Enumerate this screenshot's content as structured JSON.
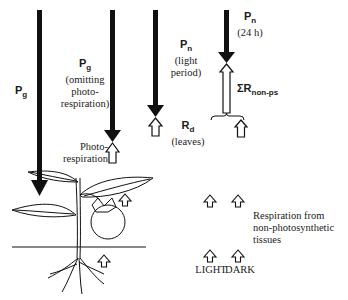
{
  "diagram": {
    "arrows": [
      {
        "id": "pg",
        "symbol": "P",
        "subscript": "g",
        "note": ""
      },
      {
        "id": "pg-omit",
        "symbol": "P",
        "subscript": "g",
        "note_lines": [
          "(omitting",
          "photo-",
          "respiration)"
        ]
      },
      {
        "id": "pn-light",
        "symbol": "P",
        "subscript": "n",
        "note_lines": [
          "(light",
          "period)"
        ]
      },
      {
        "id": "pn-24h",
        "symbol": "P",
        "subscript": "n",
        "note_lines": [
          "(24 h)"
        ]
      }
    ],
    "upward_labels": {
      "photorespiration": [
        "Photo-",
        "respiration"
      ],
      "rd": {
        "symbol": "R",
        "subscript": "d",
        "note": "(leaves)"
      },
      "sum_r": {
        "symbol": "ΣR",
        "subscript": "non-ps"
      }
    },
    "legend": {
      "respiration_lines": [
        "Respiration from",
        "non-photosynthetic",
        "tissues"
      ],
      "light": "LIGHT",
      "dark": "DARK"
    }
  }
}
